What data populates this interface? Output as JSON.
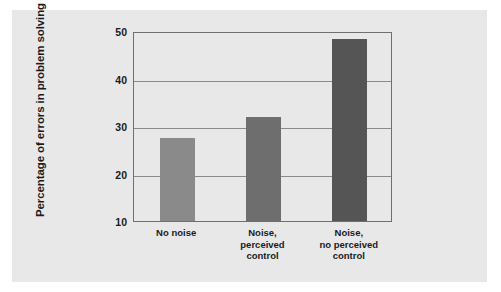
{
  "figure": {
    "background_color": "#ffffff",
    "panel_color": "#e8e8e8",
    "frame_color": "#6f6f6f"
  },
  "chart_data": {
    "type": "bar",
    "title": "",
    "subtitle": "",
    "xlabel": "",
    "ylabel": "Percentage of errors in problem solving",
    "categories": [
      "No noise",
      "Noise,\nperceived\ncontrol",
      "Noise,\nno perceived\ncontrol"
    ],
    "category_lines": [
      [
        "No noise"
      ],
      [
        "Noise,",
        "perceived",
        "control"
      ],
      [
        "Noise,",
        "no perceived",
        "control"
      ]
    ],
    "values": [
      27.4,
      32.0,
      48.3
    ],
    "bar_colors": [
      "#8a8a8a",
      "#6e6e6e",
      "#555555"
    ],
    "ylim": [
      10,
      50
    ],
    "yticks": [
      10,
      20,
      30,
      40,
      50
    ],
    "ytick_labels": [
      "10",
      "20",
      "30",
      "40",
      "50"
    ],
    "grid": true,
    "grid_axis": "y",
    "legend": null,
    "legend_position": "none",
    "annotations": []
  }
}
